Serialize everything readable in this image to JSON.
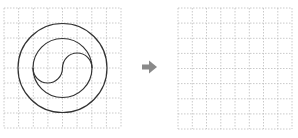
{
  "diagram": {
    "left_grid": {
      "cols": 8,
      "rows": 8,
      "shapes": [
        "outer-circle",
        "inner-circle",
        "s-curve"
      ]
    },
    "arrow": {
      "direction": "right",
      "glyph": "➜"
    },
    "right_grid": {
      "cols": 8,
      "rows": 8,
      "shapes": []
    },
    "colors": {
      "grid": "#bdbdbd",
      "stroke": "#333333",
      "arrow": "#8a8a8a"
    }
  }
}
